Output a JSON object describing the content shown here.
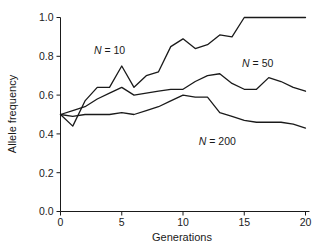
{
  "chart_data": {
    "type": "line",
    "title": "",
    "xlabel": "Generations",
    "ylabel": "Allele frequency",
    "xlim": [
      0,
      20
    ],
    "ylim": [
      0,
      1.0
    ],
    "grid": false,
    "legend_position": "inline-annotations",
    "x": [
      0,
      1,
      2,
      3,
      4,
      5,
      6,
      7,
      8,
      9,
      10,
      11,
      12,
      13,
      14,
      15,
      16,
      17,
      18,
      19,
      20
    ],
    "xticks": [
      "0",
      "5",
      "10",
      "15",
      "20"
    ],
    "xtick_values": [
      0,
      5,
      10,
      15,
      20
    ],
    "yticks": [
      "0.0",
      "0.2",
      "0.4",
      "0.6",
      "0.8",
      "1.0"
    ],
    "ytick_values": [
      0.0,
      0.2,
      0.4,
      0.6,
      0.8,
      1.0
    ],
    "series": [
      {
        "name": "N = 10",
        "label": "N = 10",
        "label_x": 4.0,
        "label_y": 0.81,
        "color": "#1a1a1a",
        "values": [
          0.5,
          0.44,
          0.57,
          0.64,
          0.64,
          0.75,
          0.64,
          0.7,
          0.72,
          0.85,
          0.89,
          0.84,
          0.86,
          0.91,
          0.9,
          1.0,
          1.0,
          1.0,
          1.0,
          1.0,
          1.0
        ]
      },
      {
        "name": "N = 50",
        "label": "N = 50",
        "label_x": 16.1,
        "label_y": 0.745,
        "color": "#1a1a1a",
        "values": [
          0.5,
          0.52,
          0.54,
          0.58,
          0.61,
          0.64,
          0.6,
          0.61,
          0.62,
          0.63,
          0.63,
          0.67,
          0.7,
          0.71,
          0.66,
          0.63,
          0.63,
          0.69,
          0.67,
          0.64,
          0.62
        ]
      },
      {
        "name": "N = 200",
        "label": "N = 200",
        "label_x": 12.8,
        "label_y": 0.345,
        "color": "#1a1a1a",
        "values": [
          0.5,
          0.49,
          0.5,
          0.5,
          0.5,
          0.51,
          0.5,
          0.52,
          0.54,
          0.57,
          0.6,
          0.59,
          0.59,
          0.51,
          0.49,
          0.47,
          0.46,
          0.46,
          0.46,
          0.45,
          0.43
        ]
      }
    ]
  }
}
